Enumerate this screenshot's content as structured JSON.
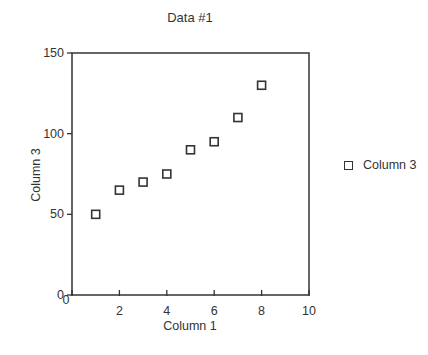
{
  "chart_data": {
    "type": "scatter",
    "title": "Data #1",
    "xlabel": "Column 1",
    "ylabel": "Column 3",
    "xlim": [
      0,
      10
    ],
    "ylim": [
      0,
      150
    ],
    "xticks": [
      0,
      2,
      4,
      6,
      8,
      10
    ],
    "yticks": [
      0,
      50,
      100,
      150
    ],
    "grid": false,
    "legend_position": "right",
    "series": [
      {
        "name": "Column 3",
        "marker": "hollow-square",
        "x": [
          1,
          2,
          3,
          4,
          5,
          6,
          7,
          8
        ],
        "y": [
          50,
          65,
          70,
          75,
          90,
          95,
          110,
          130
        ]
      }
    ]
  },
  "legend": {
    "label": "Column 3"
  }
}
